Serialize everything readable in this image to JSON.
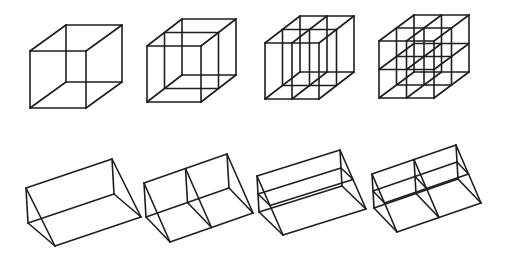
{
  "figure": {
    "background": "#ffffff",
    "stroke_color": "#1e1e1e",
    "rows": [
      {
        "name": "cube-subdivision-row",
        "shapes": [
          {
            "name": "cube-undivided",
            "type": "cube",
            "front_origin": [
              30,
              51
            ],
            "size": [
              56,
              57
            ],
            "depth_offset": [
              36,
              -26
            ],
            "divisions": {
              "x": 1,
              "y": 1,
              "z": 1
            }
          },
          {
            "name": "cube-divided-depth",
            "type": "cube",
            "front_origin": [
              147,
              46
            ],
            "size": [
              54,
              56
            ],
            "depth_offset": [
              35,
              -27
            ],
            "divisions": {
              "x": 1,
              "y": 1,
              "z": 2
            }
          },
          {
            "name": "cube-divided-width-depth",
            "type": "cube",
            "front_origin": [
              265,
              43
            ],
            "size": [
              54,
              56
            ],
            "depth_offset": [
              35,
              -27
            ],
            "divisions": {
              "x": 2,
              "y": 1,
              "z": 2
            }
          },
          {
            "name": "cube-divided-all-axes",
            "type": "cube",
            "front_origin": [
              379,
              41
            ],
            "size": [
              55,
              57
            ],
            "depth_offset": [
              35,
              -26
            ],
            "divisions": {
              "x": 2,
              "y": 2,
              "z": 2
            }
          }
        ]
      },
      {
        "name": "prism-subdivision-row",
        "shapes": [
          {
            "name": "prism-undivided",
            "type": "prism",
            "apex": [
              26,
              188
            ],
            "profile": [
              [
                0,
                0
              ],
              [
                2,
                35
              ],
              [
                29,
                58
              ]
            ],
            "length_offset": [
              86,
              -29
            ],
            "divisions": {
              "length": 1,
              "height": 1
            }
          },
          {
            "name": "prism-divided-length",
            "type": "prism",
            "apex": [
              144,
              183
            ],
            "profile": [
              [
                0,
                0
              ],
              [
                2,
                34
              ],
              [
                26,
                59
              ]
            ],
            "length_offset": [
              83,
              -29
            ],
            "divisions": {
              "length": 2,
              "height": 1
            }
          },
          {
            "name": "prism-divided-height",
            "type": "prism",
            "apex": [
              257,
              176
            ],
            "profile": [
              [
                0,
                0
              ],
              [
                2,
                36
              ],
              [
                26,
                59
              ]
            ],
            "length_offset": [
              83,
              -26
            ],
            "divisions": {
              "length": 1,
              "height": 2
            }
          },
          {
            "name": "prism-divided-length-height",
            "type": "prism",
            "apex": [
              372,
              174
            ],
            "profile": [
              [
                0,
                0
              ],
              [
                2,
                34
              ],
              [
                25,
                58
              ]
            ],
            "length_offset": [
              84,
              -29
            ],
            "divisions": {
              "length": 2,
              "height": 2
            }
          }
        ]
      }
    ]
  }
}
